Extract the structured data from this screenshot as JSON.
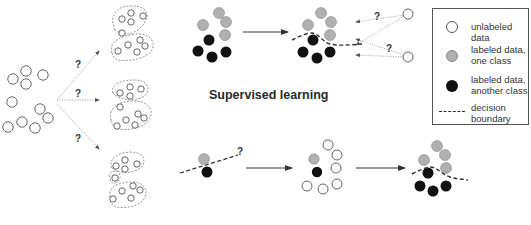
{
  "colors": {
    "background": "#ffffff",
    "unlabeled_fill": "#ffffff",
    "unlabeled_stroke": "#555555",
    "labeled_one_class": "#b0b0b0",
    "labeled_another_class": "#111111",
    "boundary": "#333333",
    "arrow": "#333333",
    "dotted_arrow": "#9a9a9a"
  },
  "captions": {
    "supervised": "Supervised learning"
  },
  "question_mark": "?",
  "legend": {
    "items": [
      {
        "swatch": "unlabeled",
        "label": "unlabeled data"
      },
      {
        "swatch": "one-class",
        "label": "labeled data,\none class"
      },
      {
        "swatch": "another-class",
        "label": "labeled data,\nanother class"
      },
      {
        "swatch": "boundary",
        "label": "decision\nboundary"
      }
    ]
  },
  "panels": {
    "unsupervised": {
      "source_points": [
        [
          13,
          79
        ],
        [
          26,
          71
        ],
        [
          26,
          84
        ],
        [
          43,
          75
        ],
        [
          12,
          102
        ],
        [
          22,
          122
        ],
        [
          40,
          109
        ],
        [
          48,
          118
        ],
        [
          35,
          128
        ],
        [
          8,
          127
        ]
      ],
      "question_labels": [
        [
          78,
          64
        ],
        [
          78,
          93
        ],
        [
          78,
          138
        ]
      ],
      "candidate_clusterings": 3
    },
    "supervised": {
      "before": {
        "gray": [
          [
            219,
            13
          ],
          [
            203,
            25
          ],
          [
            226,
            22
          ],
          [
            225,
            35
          ]
        ],
        "black": [
          [
            209,
            40
          ],
          [
            198,
            51
          ],
          [
            212,
            57
          ],
          [
            226,
            52
          ]
        ]
      },
      "after": {
        "gray": [
          [
            321,
            13
          ],
          [
            331,
            22
          ],
          [
            308,
            25
          ],
          [
            330,
            35
          ]
        ],
        "black": [
          [
            313,
            40
          ],
          [
            303,
            52
          ],
          [
            317,
            58
          ],
          [
            330,
            52
          ]
        ]
      },
      "new_points": [
        [
          408,
          14
        ],
        [
          408,
          57
        ]
      ],
      "question_labels": [
        [
          377,
          16
        ],
        [
          389,
          48
        ]
      ]
    },
    "semi_supervised": {
      "step1": {
        "gray": [
          [
            204,
            159
          ]
        ],
        "black": [
          [
            207,
            172
          ]
        ],
        "question": [
          240,
          152
        ]
      },
      "step2": {
        "gray": [
          [
            314,
            159
          ]
        ],
        "black": [
          [
            317,
            172
          ]
        ],
        "unlabeled": [
          [
            328,
            145
          ],
          [
            337,
            155
          ],
          [
            336,
            168
          ],
          [
            307,
            186
          ],
          [
            323,
            189
          ],
          [
            337,
            184
          ]
        ]
      },
      "step3": {
        "gray": [
          [
            437,
            146
          ],
          [
            445,
            155
          ],
          [
            424,
            160
          ],
          [
            446,
            168
          ]
        ],
        "black": [
          [
            428,
            173
          ],
          [
            420,
            186
          ],
          [
            433,
            191
          ],
          [
            446,
            186
          ]
        ]
      }
    }
  }
}
